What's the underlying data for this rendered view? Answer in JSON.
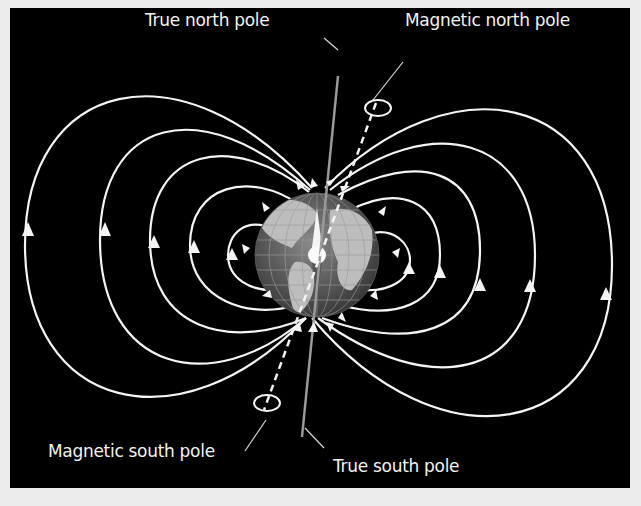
{
  "diagram": {
    "labels": {
      "true_north": "True north pole",
      "magnetic_north": "Magnetic north pole",
      "magnetic_south": "Magnetic south pole",
      "true_south": "True south pole"
    },
    "colors": {
      "background": "#000000",
      "field_lines": "#f4f4f4",
      "border": "#ececec"
    },
    "field_lines_per_side": 5,
    "field_direction": "lines exit southern hemisphere, re-enter northern hemisphere (arrows point up on outer arcs)"
  }
}
